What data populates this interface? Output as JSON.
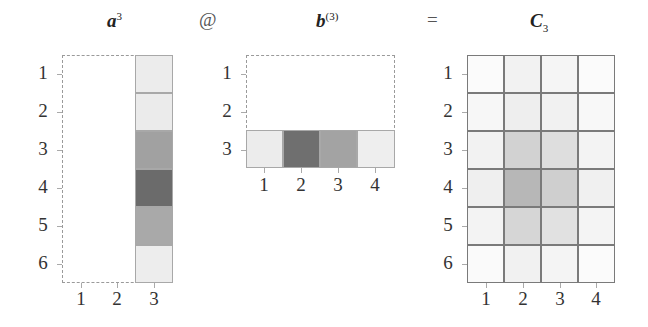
{
  "titles": {
    "a": {
      "base": "a",
      "sup": "3"
    },
    "b": {
      "base": "b",
      "sup": "(3)"
    },
    "c": {
      "base": "C",
      "sub": "3"
    }
  },
  "operators": {
    "matmul": "@",
    "equals": "="
  },
  "matrix_a": {
    "row_labels": [
      "1",
      "2",
      "3",
      "4",
      "5",
      "6"
    ],
    "col_labels": [
      "1",
      "2",
      "3"
    ],
    "active_column": 3,
    "column_values": [
      "#ececec",
      "#ebebeb",
      "#a1a1a1",
      "#6b6b6b",
      "#a9a9a9",
      "#ededed"
    ]
  },
  "matrix_b": {
    "row_labels": [
      "1",
      "2",
      "3"
    ],
    "col_labels": [
      "1",
      "2",
      "3",
      "4"
    ],
    "active_row": 3,
    "row_values": [
      "#ececec",
      "#6f6f6f",
      "#a3a3a3",
      "#eeeeee"
    ]
  },
  "matrix_c": {
    "row_labels": [
      "1",
      "2",
      "3",
      "4",
      "5",
      "6"
    ],
    "col_labels": [
      "1",
      "2",
      "3",
      "4"
    ],
    "cells": [
      [
        "#fbfbfb",
        "#f2f2f2",
        "#f5f5f5",
        "#fbfbfb"
      ],
      [
        "#f7f7f7",
        "#eeeeee",
        "#f1f1f1",
        "#f8f8f8"
      ],
      [
        "#f2f2f2",
        "#d2d2d2",
        "#dedede",
        "#f3f3f3"
      ],
      [
        "#efefef",
        "#b7b7b7",
        "#cfcfcf",
        "#f0f0f0"
      ],
      [
        "#f3f3f3",
        "#d6d6d6",
        "#e1e1e1",
        "#f4f4f4"
      ],
      [
        "#fafafa",
        "#f1f1f1",
        "#f4f4f4",
        "#fbfbfb"
      ]
    ]
  }
}
